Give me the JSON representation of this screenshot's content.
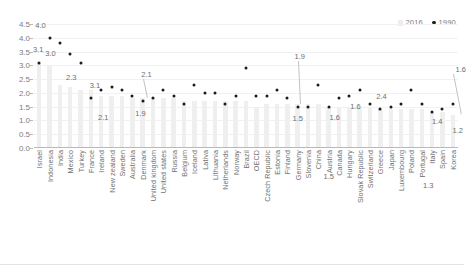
{
  "legend": {
    "series_2016_label": "2016",
    "series_1990_label": "1990",
    "bar_swatch": "bar-swatch-2016",
    "dot_swatch": "dot-swatch-1990"
  },
  "axis": {
    "y_ticks": [
      "0.0",
      "0.5",
      "1.0",
      "1.5",
      "2.0",
      "2.5",
      "3.0",
      "3.5",
      "4.0",
      "4.5"
    ],
    "y_min": 0.0,
    "y_max": 4.5
  },
  "annotations": [
    {
      "text": "4.0",
      "index": 1,
      "dx": -9,
      "dy": -12,
      "leader": false
    },
    {
      "text": "3.1",
      "index": 0,
      "dx": -1,
      "dy": -13,
      "leader": false
    },
    {
      "text": "3.0",
      "index": 1,
      "dx": 1,
      "dy": 16,
      "leader": false
    },
    {
      "text": "2.3",
      "index": 3,
      "dx": 1,
      "dy": 24,
      "leader": false
    },
    {
      "text": "3.1",
      "index": 5,
      "dx": 4,
      "dy": -12,
      "leader": false
    },
    {
      "text": "2.1",
      "index": 6,
      "dx": 2,
      "dy": 28,
      "leader": false
    },
    {
      "text": "2.1",
      "index": 10,
      "dx": 4,
      "dy": -26,
      "leader": true
    },
    {
      "text": "1.9",
      "index": 10,
      "dx": -2,
      "dy": 13,
      "leader": false
    },
    {
      "text": "1.9",
      "index": 25,
      "dx": 2,
      "dy": -50,
      "leader": true
    },
    {
      "text": "1.5",
      "index": 25,
      "dx": 0,
      "dy": 12,
      "leader": false
    },
    {
      "text": "1.6",
      "index": 28,
      "dx": 6,
      "dy": 11,
      "leader": false
    },
    {
      "text": "1.6",
      "index": 30,
      "dx": 6,
      "dy": 11,
      "leader": false
    },
    {
      "text": "1.5",
      "index": 28,
      "dx": 0,
      "dy": 70,
      "leader": false
    },
    {
      "text": "2.4",
      "index": 33,
      "dx": 1,
      "dy": -12,
      "leader": false
    },
    {
      "text": "1.4",
      "index": 38,
      "dx": 5,
      "dy": 10,
      "leader": false
    },
    {
      "text": "1.3",
      "index": 38,
      "dx": -4,
      "dy": 74,
      "leader": false
    },
    {
      "text": "1.2",
      "index": 40,
      "dx": 5,
      "dy": 27,
      "leader": false
    },
    {
      "text": "1.6",
      "index": 40,
      "dx": 8,
      "dy": -34,
      "leader": true
    }
  ],
  "chart_data": {
    "type": "bar",
    "title": "",
    "xlabel": "",
    "ylabel": "",
    "ylim": [
      0.0,
      4.5
    ],
    "grid": true,
    "legend_position": "top-right",
    "categories": [
      "Israel",
      "Indonesia",
      "India",
      "Mexico",
      "Turkey",
      "France",
      "Ireland",
      "New zealand",
      "Sweden",
      "Australia",
      "Denmark",
      "United kingdom",
      "United states",
      "Russia",
      "Belgium",
      "Iceland",
      "Lativa",
      "Lithuania",
      "Netherlands",
      "Norway",
      "Brazil",
      "OECD",
      "Czech Republic",
      "Estonia",
      "Finland",
      "Germany",
      "Slovenia",
      "China",
      "Austria",
      "Canada",
      "Hungary",
      "Slovak Republic",
      "Switzerland",
      "Greece",
      "Japan",
      "Luxembourg",
      "Poland",
      "Portugal",
      "Italy",
      "Spain",
      "Korea"
    ],
    "series": [
      {
        "name": "1990",
        "type": "scatter",
        "values": [
          3.1,
          4.0,
          3.8,
          3.4,
          3.1,
          1.8,
          2.1,
          2.2,
          2.1,
          1.9,
          1.7,
          1.8,
          2.1,
          1.9,
          1.6,
          2.3,
          2.0,
          2.0,
          1.6,
          1.9,
          2.9,
          1.9,
          1.9,
          2.1,
          1.8,
          1.5,
          1.5,
          2.3,
          1.5,
          1.8,
          1.9,
          2.1,
          1.6,
          1.4,
          1.5,
          1.6,
          2.1,
          1.6,
          1.3,
          1.4,
          1.6
        ]
      },
      {
        "name": "2016",
        "type": "bar",
        "values": [
          3.1,
          3.0,
          2.3,
          2.2,
          2.1,
          2.1,
          1.9,
          1.9,
          1.9,
          1.8,
          1.8,
          1.8,
          1.8,
          1.8,
          1.7,
          1.7,
          1.7,
          1.7,
          1.7,
          1.7,
          1.7,
          1.5,
          1.6,
          1.6,
          1.6,
          1.6,
          1.6,
          1.6,
          1.5,
          1.5,
          1.5,
          1.5,
          1.5,
          1.4,
          1.4,
          1.4,
          1.4,
          1.4,
          1.3,
          1.3,
          1.2
        ]
      }
    ]
  }
}
